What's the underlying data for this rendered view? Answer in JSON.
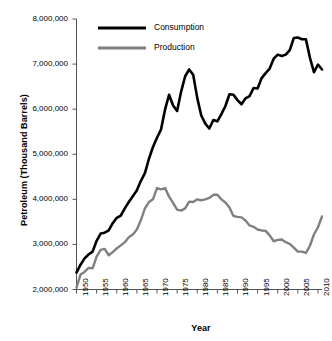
{
  "chart_data": {
    "type": "line",
    "title": "",
    "xlabel": "Year",
    "ylabel": "Petroleum (Thousand Barrels)",
    "xlim": [
      1950,
      2011
    ],
    "ylim": [
      2000000,
      8000000
    ],
    "grid": false,
    "legend_position": "top-left",
    "x_tick_labels": [
      "1950",
      "1955",
      "1960",
      "1965",
      "1970",
      "1975",
      "1980",
      "1985",
      "1990",
      "1995",
      "2000",
      "2005",
      "2010"
    ],
    "x_ticks": [
      1950,
      1955,
      1960,
      1965,
      1970,
      1975,
      1980,
      1985,
      1990,
      1995,
      2000,
      2005,
      2010
    ],
    "y_tick_labels": [
      "2,000,000",
      "3,000,000",
      "4,000,000",
      "5,000,000",
      "6,000,000",
      "7,000,000",
      "8,000,000"
    ],
    "y_ticks": [
      2000000,
      3000000,
      4000000,
      5000000,
      6000000,
      7000000,
      8000000
    ],
    "x": [
      1950,
      1951,
      1952,
      1953,
      1954,
      1955,
      1956,
      1957,
      1958,
      1959,
      1960,
      1961,
      1962,
      1963,
      1964,
      1965,
      1966,
      1967,
      1968,
      1969,
      1970,
      1971,
      1972,
      1973,
      1974,
      1975,
      1976,
      1977,
      1978,
      1979,
      1980,
      1981,
      1982,
      1983,
      1984,
      1985,
      1986,
      1987,
      1988,
      1989,
      1990,
      1991,
      1992,
      1993,
      1994,
      1995,
      1996,
      1997,
      1998,
      1999,
      2000,
      2001,
      2002,
      2003,
      2004,
      2005,
      2006,
      2007,
      2008,
      2009,
      2010,
      2011
    ],
    "series": [
      {
        "name": "Consumption",
        "color": "#000000",
        "line_width": 2.6,
        "values": [
          2375000,
          2550000,
          2690000,
          2775000,
          2840000,
          3080000,
          3240000,
          3260000,
          3310000,
          3470000,
          3590000,
          3640000,
          3800000,
          3940000,
          4070000,
          4200000,
          4410000,
          4580000,
          4900000,
          5160000,
          5365000,
          5550000,
          5990000,
          6320000,
          6080000,
          5960000,
          6390000,
          6730000,
          6880000,
          6760000,
          6250000,
          5860000,
          5680000,
          5570000,
          5760000,
          5730000,
          5890000,
          6070000,
          6330000,
          6320000,
          6200000,
          6110000,
          6240000,
          6290000,
          6470000,
          6460000,
          6690000,
          6800000,
          6900000,
          7120000,
          7210000,
          7180000,
          7210000,
          7310000,
          7580000,
          7590000,
          7550000,
          7550000,
          7140000,
          6820000,
          6990000,
          6880000
        ]
      },
      {
        "name": "Production",
        "color": "#808080",
        "line_width": 2.4,
        "values": [
          2040000,
          2330000,
          2390000,
          2480000,
          2470000,
          2730000,
          2880000,
          2900000,
          2760000,
          2830000,
          2910000,
          2980000,
          3050000,
          3160000,
          3220000,
          3330000,
          3540000,
          3800000,
          3940000,
          4000000,
          4250000,
          4220000,
          4250000,
          4060000,
          3920000,
          3770000,
          3750000,
          3800000,
          3950000,
          3940000,
          4000000,
          3980000,
          4000000,
          4030000,
          4100000,
          4100000,
          4000000,
          3930000,
          3820000,
          3630000,
          3610000,
          3600000,
          3530000,
          3420000,
          3390000,
          3330000,
          3310000,
          3300000,
          3200000,
          3070000,
          3100000,
          3110000,
          3050000,
          3010000,
          2930000,
          2840000,
          2840000,
          2810000,
          2970000,
          3220000,
          3380000,
          3620000
        ]
      }
    ]
  },
  "legend": {
    "items": [
      {
        "label": "Consumption",
        "color": "#000000"
      },
      {
        "label": "Production",
        "color": "#808080"
      }
    ]
  }
}
